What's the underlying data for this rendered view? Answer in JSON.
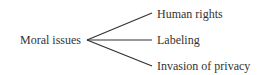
{
  "diagram": {
    "root": {
      "label": "Moral issues"
    },
    "branches": [
      {
        "label": "Human rights"
      },
      {
        "label": "Labeling"
      },
      {
        "label": "Invasion of privacy"
      }
    ],
    "line_color": "#333333"
  }
}
